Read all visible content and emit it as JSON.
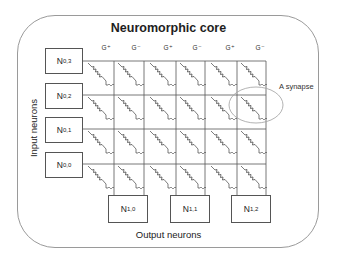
{
  "diagram": {
    "title": "Neuromorphic core",
    "conductance_labels": [
      "G⁺",
      "G⁻",
      "G⁺",
      "G⁻",
      "G⁺",
      "G⁻"
    ],
    "input_axis_label": "Input neurons",
    "output_axis_label": "Output neurons",
    "annotation": "A synapse",
    "input_neurons": [
      {
        "base": "N",
        "sub": "0,3"
      },
      {
        "base": "N",
        "sub": "0,2"
      },
      {
        "base": "N",
        "sub": "0,1"
      },
      {
        "base": "N",
        "sub": "0,0"
      }
    ],
    "output_neurons": [
      {
        "base": "N",
        "sub": "1,0"
      },
      {
        "base": "N",
        "sub": "1,1"
      },
      {
        "base": "N",
        "sub": "1,2"
      }
    ],
    "crossbar": {
      "rows": 4,
      "columns": 6,
      "synapse_symbol": "resistor"
    },
    "highlighted_synapse": {
      "row": 1,
      "columns": [
        4,
        5
      ]
    },
    "colors": {
      "lines": "#555555",
      "border": "#9a9a9a",
      "ellipse": "#a0a0a0"
    }
  }
}
